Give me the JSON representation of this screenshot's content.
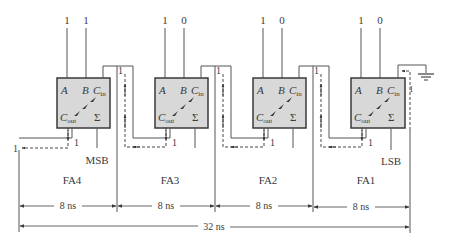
{
  "colors": {
    "box_fill": "#d8d8d8",
    "box_stroke": "#3a3a3a",
    "wire": "#555555",
    "text": "#3a3a3a",
    "background": "#ffffff"
  },
  "adders": [
    {
      "name": "FA4",
      "input_a": "1",
      "input_b": "1",
      "carry_out_value": "1",
      "sum_label": "MSB"
    },
    {
      "name": "FA3",
      "input_a": "1",
      "input_b": "0",
      "carry_out_value": "1",
      "carry_in_value": "1"
    },
    {
      "name": "FA2",
      "input_a": "1",
      "input_b": "0",
      "carry_out_value": "1",
      "carry_in_value": "1"
    },
    {
      "name": "FA1",
      "input_a": "1",
      "input_b": "0",
      "carry_out_value": "1",
      "carry_in_value": "1",
      "sum_label": "LSB"
    }
  ],
  "pins": {
    "a": "A",
    "b": "B",
    "cin": "C",
    "cin_sub": "in",
    "cout": "C",
    "cout_sub": "out",
    "sum": "Σ"
  },
  "final_carry_out": "1",
  "fa1_carry_in": "ground",
  "timing": {
    "stage_delays": [
      "8 ns",
      "8 ns",
      "8 ns",
      "8 ns"
    ],
    "total_delay": "32 ns"
  }
}
